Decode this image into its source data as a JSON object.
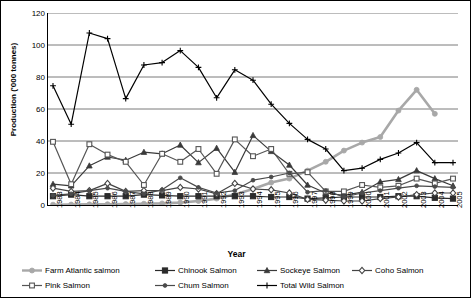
{
  "chart_data": {
    "type": "line",
    "title": "",
    "xlabel": "Year",
    "ylabel": "Production ('000 tonnes)",
    "ylim": [
      0,
      120
    ],
    "ytick_step": 20,
    "yticks": [
      "0",
      "20",
      "40",
      "60",
      "80",
      "100",
      "120"
    ],
    "grid": "horizontal",
    "legend_position": "bottom",
    "categories": [
      "1983",
      "1984",
      "1985",
      "1986",
      "1987",
      "1988",
      "1989",
      "1990",
      "1991",
      "1992",
      "1993",
      "1994",
      "1995",
      "1996",
      "1997",
      "1998",
      "1999",
      "2000",
      "2001",
      "2002",
      "2003",
      "2004",
      "2005"
    ],
    "series": [
      {
        "name": "Farm Atlantic salmon",
        "color": "#a8a8a8",
        "marker": "circle",
        "values": [
          0.2,
          0.3,
          0.4,
          0.5,
          0.6,
          0.8,
          1.0,
          1.5,
          2.5,
          4.0,
          6.5,
          10.0,
          14.0,
          16.5,
          21.5,
          27.0,
          34.0,
          39.0,
          42.5,
          59.0,
          72.0,
          57.0,
          null
        ]
      },
      {
        "name": "Chinook Salmon",
        "color": "#2b2b2b",
        "marker": "square-filled",
        "values": [
          5.5,
          6.5,
          5.5,
          5.5,
          5.5,
          6.5,
          6.0,
          5.5,
          5.5,
          5.5,
          5.5,
          5.5,
          5.0,
          5.0,
          4.0,
          4.5,
          5.0,
          5.0,
          5.0,
          5.5,
          5.5,
          4.5,
          4.0
        ]
      },
      {
        "name": "Sockeye Salmon",
        "color": "#3a3a3a",
        "marker": "triangle",
        "values": [
          13.0,
          12.0,
          24.5,
          30.0,
          28.0,
          33.0,
          32.0,
          37.5,
          26.5,
          35.5,
          20.5,
          43.5,
          33.5,
          25.0,
          12.5,
          7.5,
          6.0,
          8.0,
          14.5,
          16.0,
          21.5,
          16.5,
          12.0
        ]
      },
      {
        "name": "Coho Salmon",
        "color": "#444444",
        "marker": "diamond-open",
        "values": [
          10.5,
          8.5,
          9.0,
          13.5,
          8.5,
          9.0,
          9.0,
          11.0,
          10.0,
          7.0,
          13.5,
          10.0,
          9.5,
          7.5,
          3.5,
          3.0,
          2.5,
          2.5,
          4.0,
          5.0,
          6.5,
          7.5,
          7.5
        ]
      },
      {
        "name": "Pink Salmon",
        "color": "#555555",
        "marker": "square-open",
        "values": [
          39.5,
          13.0,
          38.0,
          31.5,
          27.0,
          12.5,
          32.0,
          27.0,
          35.0,
          19.5,
          41.0,
          30.5,
          35.0,
          19.5,
          20.5,
          8.5,
          8.5,
          12.5,
          11.0,
          12.0,
          16.5,
          13.5,
          16.5
        ]
      },
      {
        "name": "Chum Salmon",
        "color": "#4a4a4a",
        "marker": "circle-small",
        "values": [
          6.0,
          7.0,
          9.0,
          10.5,
          8.5,
          7.0,
          9.5,
          17.0,
          11.0,
          7.5,
          9.0,
          15.5,
          17.5,
          20.0,
          8.0,
          9.0,
          5.0,
          7.5,
          9.0,
          10.5,
          12.0,
          11.5,
          11.0
        ]
      },
      {
        "name": "Total Wild Salmon",
        "color": "#000000",
        "marker": "plus",
        "values": [
          74.5,
          50.5,
          107.5,
          104.0,
          66.5,
          87.5,
          89.0,
          96.5,
          86.0,
          67.0,
          84.5,
          78.0,
          63.0,
          51.0,
          41.0,
          35.0,
          21.5,
          23.0,
          28.5,
          32.5,
          39.0,
          26.5,
          26.5
        ]
      }
    ]
  },
  "legend": {
    "row1": [
      {
        "label": "Farm Atlantic salmon",
        "marker": "circle",
        "color": "#a8a8a8"
      },
      {
        "label": "Chinook Salmon",
        "marker": "square-filled",
        "color": "#2b2b2b"
      },
      {
        "label": "Sockeye Salmon",
        "marker": "triangle",
        "color": "#3a3a3a"
      },
      {
        "label": "Coho Salmon",
        "marker": "diamond-open",
        "color": "#444444"
      }
    ],
    "row2": [
      {
        "label": "Pink Salmon",
        "marker": "square-open",
        "color": "#555555"
      },
      {
        "label": "Chum Salmon",
        "marker": "circle-small",
        "color": "#4a4a4a"
      },
      {
        "label": "Total Wild Salmon",
        "marker": "plus",
        "color": "#000000"
      }
    ]
  }
}
